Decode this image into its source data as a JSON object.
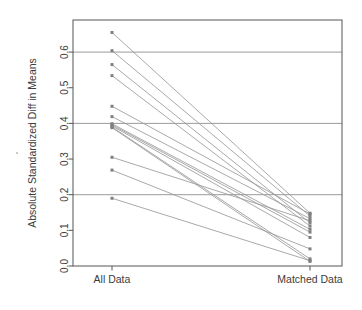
{
  "chart_data": {
    "type": "line",
    "title": "",
    "subtitle": "",
    "xlabel": "",
    "ylabel": "Absolute Standardized Diff in Means",
    "categories": [
      "All Data",
      "Matched Data"
    ],
    "x": [
      0,
      1
    ],
    "ylim": [
      0.0,
      0.69
    ],
    "yticks": [
      0.0,
      0.1,
      0.2,
      0.3,
      0.4,
      0.5,
      0.6
    ],
    "ytick_labels": [
      "0.0",
      "0.1",
      "0.2",
      "0.3",
      "0.4",
      "0.5",
      "0.6"
    ],
    "gridlines_y": [
      0.2,
      0.4,
      0.6
    ],
    "grid": true,
    "legend": "none",
    "marker": "square",
    "series": [
      {
        "name": "covariate-1",
        "values": [
          0.655,
          0.148
        ]
      },
      {
        "name": "covariate-2",
        "values": [
          0.604,
          0.14
        ]
      },
      {
        "name": "covariate-3",
        "values": [
          0.565,
          0.121
        ]
      },
      {
        "name": "covariate-4",
        "values": [
          0.534,
          0.112
        ]
      },
      {
        "name": "covariate-5",
        "values": [
          0.448,
          0.146
        ]
      },
      {
        "name": "covariate-6",
        "values": [
          0.419,
          0.133
        ]
      },
      {
        "name": "covariate-7",
        "values": [
          0.399,
          0.103
        ]
      },
      {
        "name": "covariate-8",
        "values": [
          0.396,
          0.095
        ]
      },
      {
        "name": "covariate-9",
        "values": [
          0.393,
          0.08
        ]
      },
      {
        "name": "covariate-10",
        "values": [
          0.39,
          0.02
        ]
      },
      {
        "name": "covariate-11",
        "values": [
          0.388,
          0.013
        ]
      },
      {
        "name": "covariate-12",
        "values": [
          0.305,
          0.127
        ]
      },
      {
        "name": "covariate-13",
        "values": [
          0.269,
          0.048
        ]
      },
      {
        "name": "covariate-14",
        "values": [
          0.19,
          0.015
        ]
      }
    ]
  },
  "style": {
    "line_color": "#9a9a9a",
    "marker_color": "#808080",
    "grid_color": "#8f8f8f",
    "frame_color": "#555555",
    "axis_text_color": "#3c3c3c",
    "background": "#ffffff"
  },
  "plot_geometry": {
    "left": 73,
    "right": 342,
    "top": 20,
    "bottom": 266,
    "cat_x": [
      112,
      310
    ]
  }
}
